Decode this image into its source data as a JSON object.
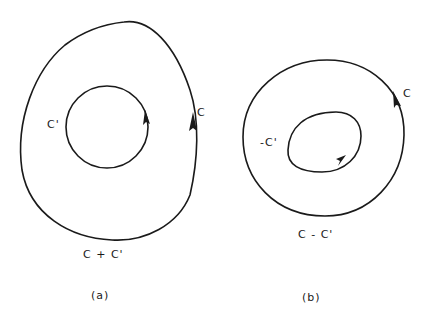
{
  "figure": {
    "panels": [
      {
        "id": "a",
        "caption": "(a)",
        "outer_label": "C",
        "inner_label": "C'",
        "combined_label": "C + C'",
        "outer_direction": "counterclockwise",
        "inner_direction": "counterclockwise"
      },
      {
        "id": "b",
        "caption": "(b)",
        "outer_label": "C",
        "inner_label": "-C'",
        "combined_label": "C - C'",
        "outer_direction": "counterclockwise",
        "inner_direction": "clockwise"
      }
    ]
  }
}
